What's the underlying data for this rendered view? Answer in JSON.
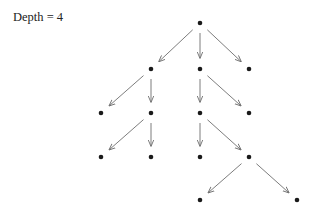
{
  "label": {
    "text": "Depth = 4"
  },
  "colors": {
    "node": "#1a1a1a",
    "edge": "#6e6e6e",
    "text": "#222222",
    "background": "#ffffff"
  },
  "tree": {
    "depth": 4,
    "nodes": [
      {
        "id": "n0",
        "x": 200,
        "y": 23
      },
      {
        "id": "n1",
        "x": 151,
        "y": 69
      },
      {
        "id": "n2",
        "x": 200,
        "y": 69
      },
      {
        "id": "n3",
        "x": 249,
        "y": 69
      },
      {
        "id": "n4",
        "x": 101,
        "y": 113
      },
      {
        "id": "n5",
        "x": 151,
        "y": 113
      },
      {
        "id": "n6",
        "x": 200,
        "y": 113
      },
      {
        "id": "n7",
        "x": 249,
        "y": 113
      },
      {
        "id": "n8",
        "x": 101,
        "y": 157
      },
      {
        "id": "n9",
        "x": 151,
        "y": 157
      },
      {
        "id": "n10",
        "x": 200,
        "y": 157
      },
      {
        "id": "n11",
        "x": 249,
        "y": 157
      },
      {
        "id": "n12",
        "x": 200,
        "y": 200
      },
      {
        "id": "n13",
        "x": 297,
        "y": 200
      }
    ],
    "edges": [
      {
        "from": "n0",
        "to": "n1"
      },
      {
        "from": "n0",
        "to": "n2"
      },
      {
        "from": "n0",
        "to": "n3"
      },
      {
        "from": "n1",
        "to": "n4"
      },
      {
        "from": "n1",
        "to": "n5"
      },
      {
        "from": "n5",
        "to": "n8"
      },
      {
        "from": "n5",
        "to": "n9"
      },
      {
        "from": "n2",
        "to": "n6"
      },
      {
        "from": "n2",
        "to": "n7"
      },
      {
        "from": "n6",
        "to": "n10"
      },
      {
        "from": "n6",
        "to": "n11"
      },
      {
        "from": "n11",
        "to": "n12"
      },
      {
        "from": "n11",
        "to": "n13"
      }
    ]
  }
}
